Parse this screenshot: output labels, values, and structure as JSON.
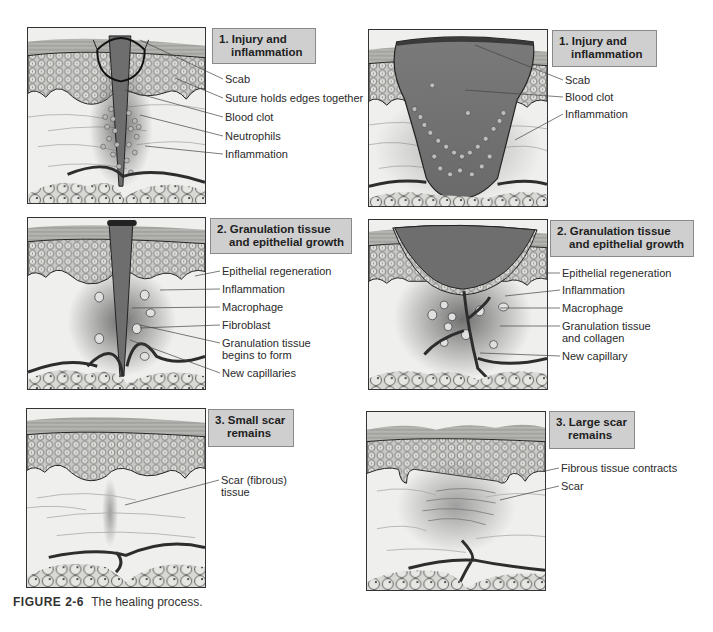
{
  "figure": {
    "number": "FIGURE 2-6",
    "caption": "The healing process."
  },
  "columns": {
    "left": {
      "panels": [
        {
          "stage_line1": "1. Injury and",
          "stage_line2": "inflammation",
          "callouts": [
            "Scab",
            "Suture holds edges together",
            "Blood clot",
            "Neutrophils",
            "Inflammation"
          ]
        },
        {
          "stage_line1": "2. Granulation tissue",
          "stage_line2": "and epithelial growth",
          "callouts": [
            "Epithelial regeneration",
            "Inflammation",
            "Macrophage",
            "Fibroblast",
            "Granulation tissue",
            "begins to form",
            "New capillaries"
          ]
        },
        {
          "stage_line1": "3. Small scar",
          "stage_line2": "remains",
          "callouts": [
            "Scar (fibrous)",
            "tissue"
          ]
        }
      ]
    },
    "right": {
      "panels": [
        {
          "stage_line1": "1. Injury and",
          "stage_line2": "inflammation",
          "callouts": [
            "Scab",
            "Blood clot",
            "Inflammation"
          ]
        },
        {
          "stage_line1": "2. Granulation tissue",
          "stage_line2": "and epithelial growth",
          "callouts": [
            "Epithelial regeneration",
            "Inflammation",
            "Macrophage",
            "Granulation tissue",
            "and collagen",
            "New capillary"
          ]
        },
        {
          "stage_line1": "3. Large scar",
          "stage_line2": "remains",
          "callouts": [
            "Fibrous tissue contracts",
            "Scar"
          ]
        }
      ]
    }
  },
  "colors": {
    "label_box": "#cfcfcf",
    "clot": "#6e6e6e",
    "dermis": "#efefed",
    "epidermis": "#bdbdbd",
    "vessel": "#2d2d2d"
  }
}
